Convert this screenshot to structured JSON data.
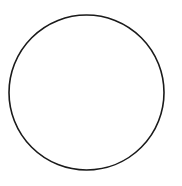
{
  "diagram": {
    "shape": "circle",
    "center": {
      "x": 86.5,
      "y": 92.5
    },
    "radius": 77.5,
    "stroke_color": "#1a1a1a",
    "stroke_width": 1.6,
    "fill_color": "#ffffff",
    "background_color": "#ffffff"
  }
}
